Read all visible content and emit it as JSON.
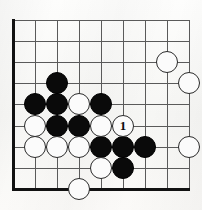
{
  "diagram": {
    "board": {
      "type": "go-board-corner",
      "visible_columns": 9,
      "visible_rows": 9,
      "edges": [
        "left",
        "bottom"
      ],
      "grid_origin_x": 13,
      "grid_origin_y": 20,
      "grid_pitch_x": 22,
      "grid_pitch_y": 21.1,
      "stone_radius": 11,
      "line_color": "#5a5a5a",
      "edge_color": "#111111",
      "background_color": "#f8f7f5",
      "black_color": "#0a0a0a",
      "white_color": "#fbfbfb"
    },
    "stones": [
      {
        "id": "b1",
        "color": "black",
        "col": 3,
        "row": 4,
        "label": ""
      },
      {
        "id": "b2",
        "color": "black",
        "col": 2,
        "row": 5,
        "label": ""
      },
      {
        "id": "b3",
        "color": "black",
        "col": 3,
        "row": 5,
        "label": ""
      },
      {
        "id": "b4",
        "color": "black",
        "col": 5,
        "row": 5,
        "label": ""
      },
      {
        "id": "b5",
        "color": "black",
        "col": 3,
        "row": 6,
        "label": ""
      },
      {
        "id": "b6",
        "color": "black",
        "col": 4,
        "row": 6,
        "label": ""
      },
      {
        "id": "b7",
        "color": "black",
        "col": 5,
        "row": 7,
        "label": ""
      },
      {
        "id": "b8",
        "color": "black",
        "col": 6,
        "row": 7,
        "label": ""
      },
      {
        "id": "b9",
        "color": "black",
        "col": 7,
        "row": 7,
        "label": ""
      },
      {
        "id": "b10",
        "color": "black",
        "col": 6,
        "row": 8,
        "label": ""
      },
      {
        "id": "w1",
        "color": "white",
        "col": 8,
        "row": 3,
        "label": ""
      },
      {
        "id": "w2",
        "color": "white",
        "col": 9,
        "row": 4,
        "label": ""
      },
      {
        "id": "w3",
        "color": "white",
        "col": 4,
        "row": 5,
        "label": ""
      },
      {
        "id": "w4",
        "color": "white",
        "col": 2,
        "row": 6,
        "label": ""
      },
      {
        "id": "w5",
        "color": "white",
        "col": 5,
        "row": 6,
        "label": ""
      },
      {
        "id": "w6",
        "color": "white",
        "col": 2,
        "row": 7,
        "label": ""
      },
      {
        "id": "w7",
        "color": "white",
        "col": 3,
        "row": 7,
        "label": ""
      },
      {
        "id": "w8",
        "color": "white",
        "col": 4,
        "row": 7,
        "label": ""
      },
      {
        "id": "w9",
        "color": "white",
        "col": 9,
        "row": 7,
        "label": ""
      },
      {
        "id": "w10",
        "color": "white",
        "col": 5,
        "row": 8,
        "label": ""
      },
      {
        "id": "w11",
        "color": "white",
        "col": 4,
        "row": 9,
        "label": ""
      },
      {
        "id": "move1",
        "color": "white",
        "col": 6,
        "row": 6,
        "label": "1"
      }
    ]
  }
}
